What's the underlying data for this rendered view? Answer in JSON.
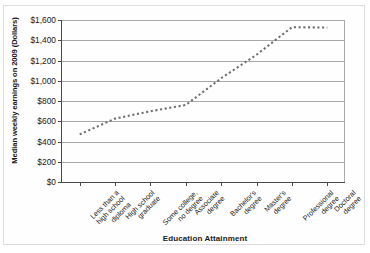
{
  "chart_data": {
    "type": "line",
    "title": "",
    "xlabel": "Education Attainment",
    "ylabel": "Median weekly earnings on 2009 (Dollars)",
    "categories": [
      "Less than a\nhigh school\ndiploma",
      "High school\ngraduate",
      "Some college,\nno degree",
      "Associate\ndegree",
      "Bachelor's\ndegree",
      "Master's\ndegree",
      "Professional\ndegree",
      "Doctoral\ndegree"
    ],
    "category_labels_flat": [
      "Less than a high school diploma",
      "High school graduate",
      "Some college, no degree",
      "Associate degree",
      "Bachelor's degree",
      "Master's degree",
      "Professional degree",
      "Doctoral degree"
    ],
    "values": [
      470,
      626,
      699,
      761,
      1025,
      1257,
      1529,
      1525
    ],
    "ylim": [
      0,
      1600
    ],
    "ytick_values": [
      0,
      200,
      400,
      600,
      800,
      1000,
      1200,
      1400,
      1600
    ],
    "ytick_labels": [
      "$0",
      "$200",
      "$400",
      "$600",
      "$800",
      "$1,000",
      "$1,200",
      "$1,400",
      "$1,600"
    ],
    "grid": true,
    "legend": false,
    "marker": "dotted-square",
    "series_color": "#6e6e6e",
    "grid_color": "#a8a8a8",
    "axis_color": "#4a4a4a",
    "background_color": "#ffffff"
  }
}
